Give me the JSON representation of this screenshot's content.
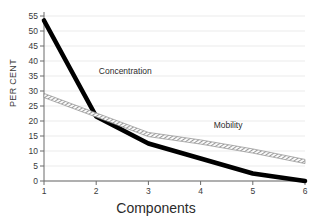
{
  "chart_data": {
    "type": "line",
    "title": "",
    "xlabel": "Components",
    "ylabel": "PER CENT",
    "x": [
      1,
      2,
      3,
      4,
      5,
      6
    ],
    "xticklabels": [
      "1",
      "2",
      "3",
      "4",
      "5",
      "6"
    ],
    "yticklabels": [
      "0",
      "5",
      "10",
      "15",
      "20",
      "25",
      "30",
      "35",
      "40",
      "45",
      "50",
      "55"
    ],
    "yticks": [
      0,
      5,
      10,
      15,
      20,
      25,
      30,
      35,
      40,
      45,
      50,
      55
    ],
    "xlim": [
      1,
      6
    ],
    "ylim": [
      0,
      55
    ],
    "grid": "horizontal",
    "legend_position": "inline-annotations",
    "series": [
      {
        "name": "Concentration",
        "style": "thick-solid-black",
        "color": "#000000",
        "values": [
          53.5,
          21.5,
          12.5,
          7.5,
          2.5,
          0.0
        ],
        "label_x": 2.05,
        "label_y": 36.5
      },
      {
        "name": "Mobility",
        "style": "hatched-band",
        "color": "#8a8a8a",
        "values": [
          28.5,
          22.0,
          15.5,
          13.0,
          10.0,
          6.5
        ],
        "label_x": 4.25,
        "label_y": 18.5
      }
    ],
    "gridline_color": "#ebebeb",
    "axis_color": "#6a6a6a"
  },
  "axes": {
    "y_title": "PER CENT",
    "x_title": "Components"
  }
}
